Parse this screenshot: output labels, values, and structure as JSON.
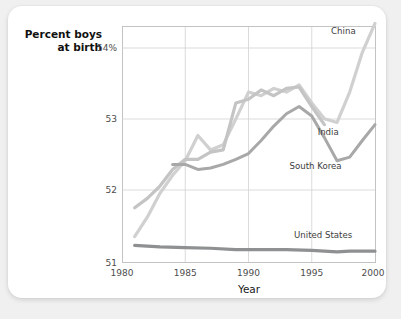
{
  "card": {
    "background": "#ffffff",
    "page_background": "#f0f0f0"
  },
  "chart_data": {
    "type": "line",
    "title": "",
    "ylabel_line1": "Percent boys",
    "ylabel_line2": "at birth",
    "xlabel": "Year",
    "xlim": [
      1980,
      2000
    ],
    "ylim": [
      51,
      54.25
    ],
    "xticks": [
      "1980",
      "1985",
      "1990",
      "1995",
      "2000"
    ],
    "xtick_values": [
      1980,
      1985,
      1990,
      1995,
      2000
    ],
    "yticks": [
      "51",
      "52",
      "53",
      "54%"
    ],
    "ytick_values": [
      51,
      52,
      53,
      54
    ],
    "grid": true,
    "legend_position": "inline-labels",
    "colors": {
      "china": "#d0d0d0",
      "india": "#c4c4c4",
      "south_korea": "#a8a8a8",
      "united_states": "#8f9092",
      "gridline": "#d2d2d2",
      "frame": "#c3c3c3",
      "text": "#3d3d3d"
    },
    "series": [
      {
        "name": "China",
        "label": "China",
        "color": "#d0d0d0",
        "x": [
          1981,
          1982,
          1983,
          1984,
          1985,
          1986,
          1987,
          1988,
          1989,
          1990,
          1991,
          1992,
          1993,
          1994,
          1995,
          1996,
          1997,
          1998,
          1999,
          2000
        ],
        "values": [
          51.35,
          51.62,
          51.95,
          52.2,
          52.4,
          52.75,
          52.55,
          52.62,
          52.98,
          53.35,
          53.3,
          53.4,
          53.35,
          53.45,
          53.2,
          52.98,
          52.93,
          53.35,
          53.9,
          54.3
        ]
      },
      {
        "name": "India",
        "label": "India",
        "color": "#c4c4c4",
        "x": [
          1981,
          1982,
          1983,
          1984,
          1985,
          1986,
          1987,
          1988,
          1989,
          1990,
          1991,
          1992,
          1993,
          1994,
          1995,
          1996
        ],
        "values": [
          51.75,
          51.88,
          52.05,
          52.28,
          52.42,
          52.42,
          52.52,
          52.55,
          53.2,
          53.25,
          53.38,
          53.3,
          53.4,
          53.42,
          53.15,
          52.9
        ]
      },
      {
        "name": "South Korea",
        "label": "South Korea",
        "color": "#a8a8a8",
        "x": [
          1984,
          1985,
          1986,
          1987,
          1988,
          1989,
          1990,
          1991,
          1992,
          1993,
          1994,
          1995,
          1996,
          1997,
          1998,
          1999,
          2000
        ],
        "values": [
          52.35,
          52.35,
          52.28,
          52.3,
          52.35,
          52.42,
          52.5,
          52.68,
          52.88,
          53.05,
          53.15,
          53.02,
          52.72,
          52.4,
          52.45,
          52.68,
          52.9
        ]
      },
      {
        "name": "United States",
        "label": "United States",
        "color": "#8f9092",
        "x": [
          1981,
          1983,
          1985,
          1987,
          1989,
          1991,
          1993,
          1995,
          1997,
          1998,
          2000
        ],
        "values": [
          51.23,
          51.21,
          51.2,
          51.19,
          51.17,
          51.17,
          51.17,
          51.16,
          51.14,
          51.15,
          51.15
        ]
      }
    ],
    "annotations": [
      {
        "text": "China",
        "x": 1997.5,
        "y": 54.15
      },
      {
        "text": "India",
        "x": 1996.3,
        "y": 52.75
      },
      {
        "text": "South Korea",
        "x": 1995.3,
        "y": 52.28
      },
      {
        "text": "United States",
        "x": 1995.9,
        "y": 51.33
      }
    ]
  }
}
